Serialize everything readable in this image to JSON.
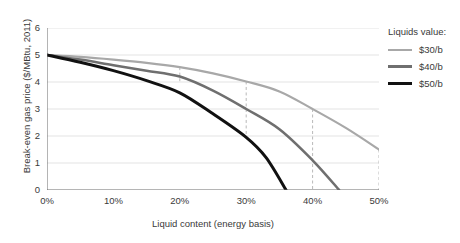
{
  "chart_data": {
    "type": "line",
    "title": "",
    "xlabel": "Liquid content (energy basis)",
    "ylabel": "Break-even gas price ($/MBtu, 2011)",
    "xlim": [
      0,
      50
    ],
    "ylim": [
      0,
      6
    ],
    "x_tick_labels": [
      "0%",
      "10%",
      "20%",
      "30%",
      "40%",
      "50%"
    ],
    "x_ticks": [
      0,
      10,
      20,
      30,
      40,
      50
    ],
    "y_tick_labels": [
      "0",
      "1",
      "2",
      "3",
      "4",
      "5",
      "6"
    ],
    "y_ticks": [
      0,
      1,
      2,
      3,
      4,
      5,
      6
    ],
    "grid": "horizontal",
    "legend_position": "right",
    "legend_title": "Liquids value:",
    "series": [
      {
        "name": "$30/b",
        "color": "#a8a8a8",
        "points": [
          [
            0,
            5.0
          ],
          [
            5,
            4.93
          ],
          [
            10,
            4.83
          ],
          [
            15,
            4.71
          ],
          [
            20,
            4.55
          ],
          [
            25,
            4.32
          ],
          [
            30,
            4.02
          ],
          [
            35,
            3.65
          ],
          [
            40,
            3.0
          ],
          [
            45,
            2.3
          ],
          [
            50,
            1.5
          ]
        ]
      },
      {
        "name": "$40/b",
        "color": "#6f6f6f",
        "points": [
          [
            0,
            5.0
          ],
          [
            5,
            4.83
          ],
          [
            10,
            4.62
          ],
          [
            15,
            4.42
          ],
          [
            20,
            4.2
          ],
          [
            25,
            3.68
          ],
          [
            30,
            3.0
          ],
          [
            35,
            2.25
          ],
          [
            40,
            1.1
          ],
          [
            44,
            0.0
          ]
        ]
      },
      {
        "name": "$50/b",
        "color": "#111111",
        "points": [
          [
            0,
            5.0
          ],
          [
            5,
            4.73
          ],
          [
            10,
            4.42
          ],
          [
            15,
            4.05
          ],
          [
            20,
            3.6
          ],
          [
            25,
            2.82
          ],
          [
            30,
            1.95
          ],
          [
            33,
            1.2
          ],
          [
            36,
            0.0
          ]
        ]
      }
    ],
    "annotations": [
      {
        "type": "vline-dashed",
        "x": 20,
        "y_top": 4.55,
        "y_bottom": 3.95
      },
      {
        "type": "vline-dashed",
        "x": 30,
        "y_top": 4.02,
        "y_bottom": 2.0
      },
      {
        "type": "vline-dashed",
        "x": 40,
        "y_top": 3.0,
        "y_bottom": 0.0
      },
      {
        "type": "vline-dashed",
        "x": 50,
        "y_top": 1.5,
        "y_bottom": 0.0
      }
    ]
  },
  "legend": {
    "title": "Liquids value:",
    "items": [
      {
        "label": "$30/b",
        "color": "#a8a8a8",
        "thickness": "2.5px"
      },
      {
        "label": "$40/b",
        "color": "#6f6f6f",
        "thickness": "3px"
      },
      {
        "label": "$50/b",
        "color": "#111111",
        "thickness": "3.5px"
      }
    ]
  }
}
